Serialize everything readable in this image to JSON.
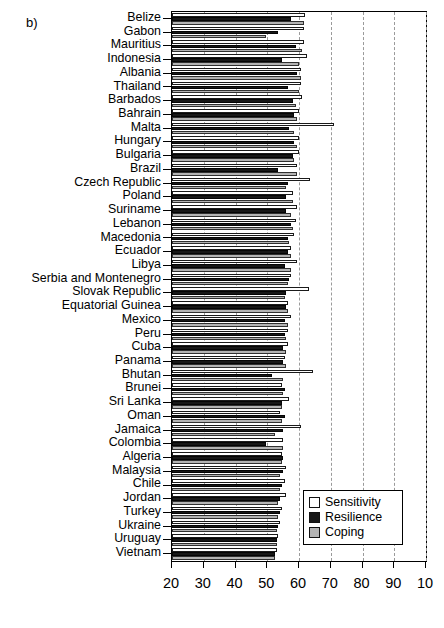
{
  "panel": {
    "label": "b)"
  },
  "legend": {
    "items": [
      {
        "key": "sensitivity",
        "label": "Sensitivity",
        "color": "#ffffff"
      },
      {
        "key": "resilience",
        "label": "Resilience",
        "color": "#171717"
      },
      {
        "key": "coping",
        "label": "Coping",
        "color": "#b3b3b3"
      }
    ]
  },
  "chart_data": {
    "type": "bar",
    "orientation": "horizontal",
    "grouped": true,
    "title": "",
    "xlabel": "",
    "ylabel": "",
    "xlim": [
      20,
      100
    ],
    "xticks": [
      20,
      30,
      40,
      50,
      60,
      70,
      80,
      90,
      100
    ],
    "xticklabels": [
      "20",
      "30",
      "40",
      "50",
      "60",
      "70",
      "80",
      "90",
      "10"
    ],
    "grid": "vertical-dashed",
    "legend_position": "lower-right-inside",
    "categories": [
      "Belize",
      "Gabon",
      "Mauritius",
      "Indonesia",
      "Albania",
      "Thailand",
      "Barbados",
      "Bahrain",
      "Malta",
      "Hungary",
      "Bulgaria",
      "Brazil",
      "Czech Republic",
      "Poland",
      "Suriname",
      "Lebanon",
      "Macedonia",
      "Ecuador",
      "Libya",
      "Serbia and Montenegro",
      "Slovak Republic",
      "Equatorial Guinea",
      "Mexico",
      "Peru",
      "Cuba",
      "Panama",
      "Bhutan",
      "Brunei",
      "Sri Lanka",
      "Oman",
      "Jamaica",
      "Colombia",
      "Algeria",
      "Malaysia",
      "Chile",
      "Jordan",
      "Turkey",
      "Ukraine",
      "Uruguay",
      "Vietnam"
    ],
    "series": [
      {
        "name": "Sensitivity",
        "values": [
          62.0,
          61.5,
          61.5,
          62.5,
          60.5,
          60.5,
          61.0,
          60.0,
          71.0,
          60.0,
          60.0,
          59.5,
          63.5,
          58.0,
          59.5,
          59.0,
          58.5,
          57.5,
          59.5,
          57.5,
          63.0,
          56.5,
          57.5,
          56.5,
          56.5,
          55.5,
          64.5,
          54.5,
          57.0,
          54.0,
          60.5,
          55.0,
          54.5,
          56.0,
          55.5,
          56.0,
          54.5,
          54.0,
          53.5,
          53.0
        ]
      },
      {
        "name": "Resilience",
        "values": [
          57.5,
          53.5,
          59.0,
          54.5,
          59.5,
          56.5,
          58.0,
          58.5,
          57.0,
          58.5,
          58.0,
          53.5,
          56.5,
          56.0,
          56.0,
          57.5,
          56.5,
          56.5,
          55.5,
          57.0,
          56.0,
          56.0,
          55.5,
          55.5,
          55.0,
          55.0,
          51.5,
          55.5,
          54.5,
          55.5,
          55.0,
          49.5,
          55.0,
          55.0,
          54.5,
          54.0,
          54.0,
          53.5,
          53.0,
          52.5
        ]
      },
      {
        "name": "Coping",
        "values": [
          61.5,
          49.5,
          61.0,
          60.0,
          60.5,
          60.0,
          59.0,
          59.5,
          58.5,
          59.5,
          58.5,
          59.5,
          56.0,
          58.0,
          57.5,
          58.0,
          57.0,
          57.5,
          57.5,
          56.5,
          55.5,
          56.5,
          56.5,
          56.0,
          56.0,
          56.0,
          55.0,
          55.0,
          54.5,
          54.5,
          52.5,
          55.0,
          54.5,
          54.0,
          54.0,
          53.5,
          53.5,
          53.0,
          53.0,
          52.5
        ]
      }
    ]
  }
}
